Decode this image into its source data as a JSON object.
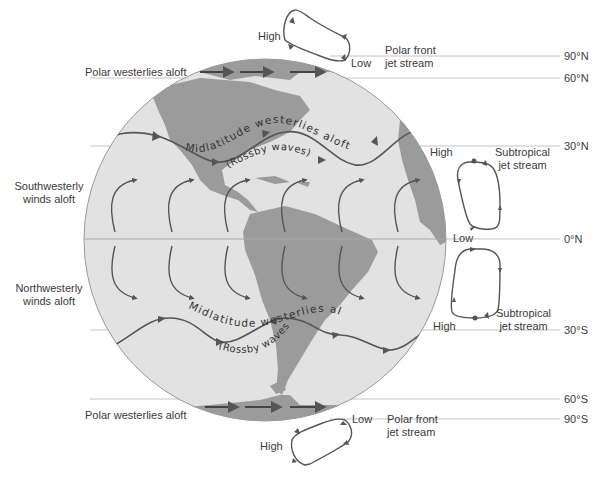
{
  "colors": {
    "ocean": "#e2e2e2",
    "land": "#9b9b9b",
    "arrow": "#555555",
    "latitude_line": "#bdbdbd",
    "text": "#3a3a3a"
  },
  "latitudes": [
    {
      "label": "90°N",
      "y": 56
    },
    {
      "label": "60°N",
      "y": 78
    },
    {
      "label": "30°N",
      "y": 146
    },
    {
      "label": "0°N",
      "y": 239
    },
    {
      "label": "30°S",
      "y": 330
    },
    {
      "label": "60°S",
      "y": 399
    },
    {
      "label": "90°S",
      "y": 419
    }
  ],
  "labels": {
    "polar_westerlies_north": "Polar westerlies aloft",
    "polar_westerlies_south": "Polar westerlies aloft",
    "midlatitude_north": "Midlatitude westerlies aloft",
    "rossby_north": "(Rossby waves)",
    "midlatitude_south": "Midlatitude westerlies aloft",
    "rossby_south": "(Rossby waves)",
    "southwesterly_line1": "Southwesterly",
    "southwesterly_line2": "winds aloft",
    "northwesterly_line1": "Northwesterly",
    "northwesterly_line2": "winds aloft"
  },
  "cells": {
    "polar_north": {
      "high": "High",
      "low": "Low",
      "jet_line1": "Polar front",
      "jet_line2": "jet stream"
    },
    "subtropical_north": {
      "high": "High",
      "jet_line1": "Subtropical",
      "jet_line2": "jet stream"
    },
    "equator": {
      "low": "Low"
    },
    "subtropical_south": {
      "high": "High",
      "jet_line1": "Subtropical",
      "jet_line2": "jet stream"
    },
    "polar_south": {
      "high": "High",
      "low": "Low",
      "jet_line1": "Polar front",
      "jet_line2": "jet stream"
    }
  }
}
